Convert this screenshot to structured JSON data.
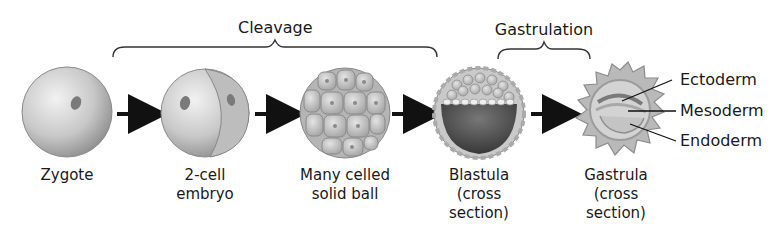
{
  "phases": {
    "cleavage": "Cleavage",
    "gastrulation": "Gastrulation"
  },
  "stages": [
    {
      "line1": "Zygote",
      "line2": "",
      "line3": ""
    },
    {
      "line1": "2-cell",
      "line2": "embryo",
      "line3": ""
    },
    {
      "line1": "Many celled",
      "line2": "solid ball",
      "line3": ""
    },
    {
      "line1": "Blastula",
      "line2": "(cross",
      "line3": "section)"
    },
    {
      "line1": "Gastrula",
      "line2": "(cross",
      "line3": "section)"
    }
  ],
  "germ_layers": [
    "Ectoderm",
    "Mesoderm",
    "Endoderm"
  ],
  "colors": {
    "cell_light": "#e6e6e6",
    "cell_mid": "#b9b9b9",
    "cell_dark": "#8a8a8a",
    "blastocoel": "#555555",
    "arrow": "#111111",
    "text": "#1a1a1a"
  }
}
